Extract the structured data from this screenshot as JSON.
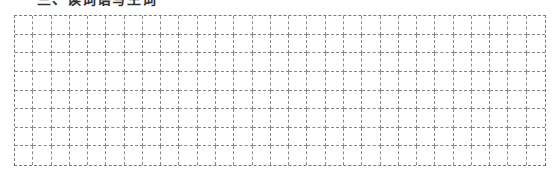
{
  "section": {
    "title": "三、读词语写生词"
  },
  "grid": {
    "rows": 8,
    "columns": 29,
    "line_color": "#7a7a7a",
    "line_style": "dashed"
  }
}
